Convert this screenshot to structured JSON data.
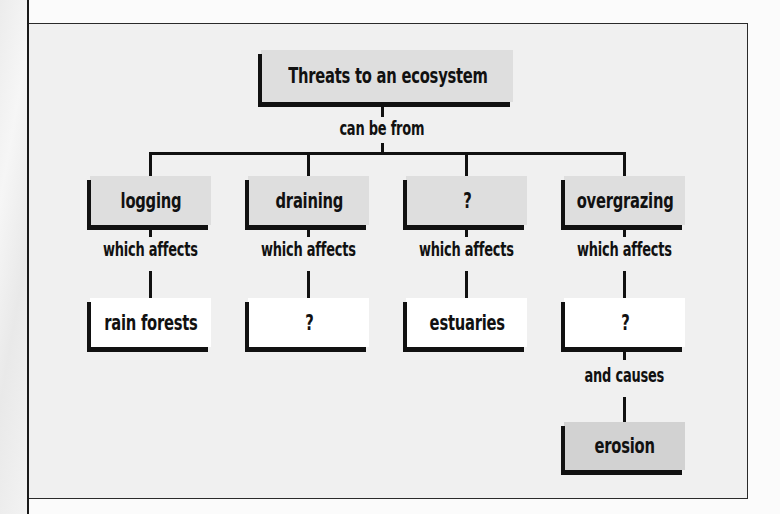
{
  "diagram": {
    "type": "concept-map",
    "root": {
      "label": "Threats to an ecosystem"
    },
    "root_link": "can be from",
    "branches": [
      {
        "cause": "logging",
        "link": "which affects",
        "effect": "rain forests"
      },
      {
        "cause": "draining",
        "link": "which affects",
        "effect": "?"
      },
      {
        "cause": "?",
        "link": "which affects",
        "effect": "estuaries"
      },
      {
        "cause": "overgrazing",
        "link": "which affects",
        "effect": "?",
        "effect_link": "and causes",
        "result": "erosion"
      }
    ]
  },
  "colors": {
    "frame_background": "#f0f0f0",
    "cause_box": "#dedede",
    "effect_box": "#ffffff",
    "result_box": "#d2d2d2",
    "lines": "#111111"
  }
}
